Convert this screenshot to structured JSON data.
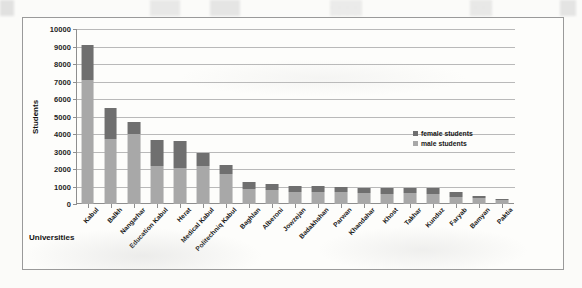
{
  "chart_data": {
    "type": "bar",
    "subtype": "stacked-vertical",
    "title": "",
    "xlabel": "Universities",
    "ylabel": "Students",
    "ylim": [
      0,
      10000
    ],
    "ytick_step": 1000,
    "yticks": [
      "10000",
      "9000",
      "8000",
      "7000",
      "6000",
      "5000",
      "4000",
      "3000",
      "2000",
      "1000",
      "0"
    ],
    "grid": true,
    "legend_position": "middle-right",
    "categories": [
      "Kabul",
      "Balkh",
      "Nangarhar",
      "Education Kabul",
      "Herat",
      "Medical Kabul",
      "Politechniq Kabul",
      "Baghlan",
      "Alberoni",
      "Jowzejan",
      "Badakhshan",
      "Parwan",
      "Khandahar",
      "Khost",
      "Takhar",
      "Kunduz",
      "Faryab",
      "Bamyan",
      "Paktia"
    ],
    "series": [
      {
        "name": "male students",
        "color": "#a8a8a8",
        "values": [
          7100,
          3700,
          4000,
          2200,
          2050,
          2200,
          1700,
          850,
          800,
          700,
          700,
          700,
          620,
          600,
          620,
          600,
          420,
          330,
          250
        ]
      },
      {
        "name": "female students",
        "color": "#6f6f6f",
        "values": [
          2000,
          1800,
          700,
          1450,
          1570,
          700,
          550,
          400,
          330,
          330,
          330,
          300,
          320,
          320,
          300,
          300,
          250,
          130,
          60
        ]
      }
    ],
    "totals": [
      9100,
      5500,
      4700,
      3650,
      3620,
      2900,
      2250,
      1250,
      1130,
      1030,
      1030,
      1000,
      940,
      920,
      920,
      900,
      670,
      460,
      310
    ]
  },
  "legend": {
    "items": [
      {
        "label": "female students",
        "color": "#6f6f6f"
      },
      {
        "label": "male students",
        "color": "#a8a8a8"
      }
    ]
  }
}
